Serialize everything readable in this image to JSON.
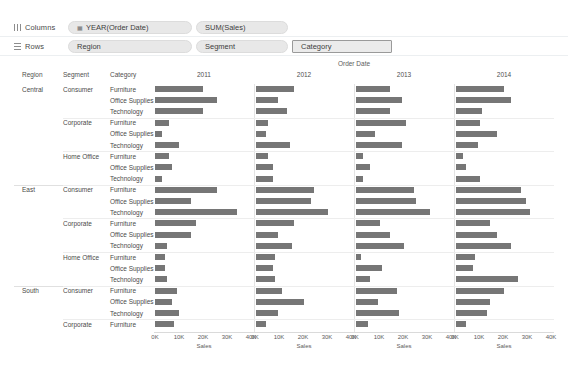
{
  "shelves": {
    "columns": {
      "label": "Columns",
      "icon": "columns-grip-icon",
      "pills": [
        {
          "label": "YEAR(Order Date)",
          "icon": "calendar-icon"
        },
        {
          "label": "SUM(Sales)",
          "icon": ""
        }
      ]
    },
    "rows": {
      "label": "Rows",
      "icon": "rows-grip-icon",
      "pills": [
        {
          "label": "Region",
          "icon": ""
        },
        {
          "label": "Segment",
          "icon": ""
        },
        {
          "label": "Category",
          "icon": ""
        }
      ]
    }
  },
  "viz": {
    "column_field_title": "Order Date",
    "row_header_labels": [
      "Region",
      "Segment",
      "Category"
    ],
    "axis_title": "Sales"
  },
  "chart_data": {
    "type": "bar",
    "title": "Order Date",
    "xlabel": "Sales",
    "ylabel": "",
    "xlim": [
      0,
      40000
    ],
    "xticks": [
      "0K",
      "10K",
      "20K",
      "30K",
      "40K"
    ],
    "xtick_values": [
      0,
      10000,
      20000,
      30000,
      40000
    ],
    "grid": false,
    "legend": "none",
    "panel_field": "YEAR(Order Date)",
    "panels": [
      "2011",
      "2012",
      "2013",
      "2014"
    ],
    "row_fields": [
      "Region",
      "Segment",
      "Category"
    ],
    "rows": [
      {
        "region": "Central",
        "segment": "Consumer",
        "category": "Furniture",
        "values": [
          20000,
          16000,
          14000,
          20000
        ]
      },
      {
        "region": "Central",
        "segment": "Consumer",
        "category": "Office Supplies",
        "values": [
          26000,
          9000,
          19000,
          23000
        ]
      },
      {
        "region": "Central",
        "segment": "Consumer",
        "category": "Technology",
        "values": [
          20000,
          13000,
          14000,
          11000
        ]
      },
      {
        "region": "Central",
        "segment": "Corporate",
        "category": "Furniture",
        "values": [
          6000,
          5000,
          21000,
          10000
        ]
      },
      {
        "region": "Central",
        "segment": "Corporate",
        "category": "Office Supplies",
        "values": [
          3000,
          4000,
          8000,
          17000
        ]
      },
      {
        "region": "Central",
        "segment": "Corporate",
        "category": "Technology",
        "values": [
          10000,
          14000,
          19000,
          9000
        ]
      },
      {
        "region": "Central",
        "segment": "Home Office",
        "category": "Furniture",
        "values": [
          6000,
          5000,
          3000,
          3000
        ]
      },
      {
        "region": "Central",
        "segment": "Home Office",
        "category": "Office Supplies",
        "values": [
          7000,
          7000,
          6000,
          4000
        ]
      },
      {
        "region": "Central",
        "segment": "Home Office",
        "category": "Technology",
        "values": [
          3000,
          7000,
          3000,
          10000
        ]
      },
      {
        "region": "East",
        "segment": "Consumer",
        "category": "Furniture",
        "values": [
          26000,
          24000,
          24000,
          27000
        ]
      },
      {
        "region": "East",
        "segment": "Consumer",
        "category": "Office Supplies",
        "values": [
          15000,
          23000,
          25000,
          29000
        ]
      },
      {
        "region": "East",
        "segment": "Consumer",
        "category": "Technology",
        "values": [
          34000,
          30000,
          31000,
          31000
        ]
      },
      {
        "region": "East",
        "segment": "Corporate",
        "category": "Furniture",
        "values": [
          17000,
          16000,
          10000,
          14000
        ]
      },
      {
        "region": "East",
        "segment": "Corporate",
        "category": "Office Supplies",
        "values": [
          15000,
          9000,
          14000,
          17000
        ]
      },
      {
        "region": "East",
        "segment": "Corporate",
        "category": "Technology",
        "values": [
          5000,
          15000,
          20000,
          23000
        ]
      },
      {
        "region": "East",
        "segment": "Home Office",
        "category": "Furniture",
        "values": [
          4000,
          8000,
          2000,
          8000
        ]
      },
      {
        "region": "East",
        "segment": "Home Office",
        "category": "Office Supplies",
        "values": [
          4000,
          7000,
          11000,
          7000
        ]
      },
      {
        "region": "East",
        "segment": "Home Office",
        "category": "Technology",
        "values": [
          5000,
          8000,
          6000,
          26000
        ]
      },
      {
        "region": "South",
        "segment": "Consumer",
        "category": "Furniture",
        "values": [
          9000,
          11000,
          17000,
          20000
        ]
      },
      {
        "region": "South",
        "segment": "Consumer",
        "category": "Office Supplies",
        "values": [
          7000,
          20000,
          9000,
          14000
        ]
      },
      {
        "region": "South",
        "segment": "Consumer",
        "category": "Technology",
        "values": [
          10000,
          9000,
          18000,
          13000
        ]
      },
      {
        "region": "South",
        "segment": "Corporate",
        "category": "Furniture",
        "values": [
          8000,
          4000,
          5000,
          4000
        ]
      }
    ]
  }
}
